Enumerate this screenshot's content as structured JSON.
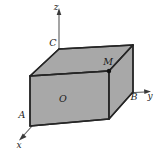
{
  "figure": {
    "background_color": "#ffffff",
    "box_fill_color": "#a8a8a8",
    "box_edge_color": "#262626",
    "axis_color": "#4a4a4a",
    "point_color": "#111111",
    "axes": [
      {
        "name": "z-axis",
        "label": "z",
        "label_x": 57,
        "label_y": 9
      },
      {
        "name": "y-axis",
        "label": "y",
        "label_x": 150,
        "label_y": 98
      },
      {
        "name": "x-axis",
        "label": "x",
        "label_x": 18,
        "label_y": 145
      }
    ],
    "vertices": [
      {
        "name": "origin",
        "label": "O",
        "label_x": 59,
        "label_y": 99
      },
      {
        "name": "vertex-A",
        "label": "A",
        "label_x": 22,
        "label_y": 116
      },
      {
        "name": "vertex-B",
        "label": "B",
        "label_x": 133,
        "label_y": 99
      },
      {
        "name": "vertex-C",
        "label": "C",
        "label_x": 52,
        "label_y": 45
      },
      {
        "name": "point-M",
        "label": "M",
        "label_x": 105,
        "label_y": 63
      }
    ],
    "marked_points": [
      {
        "name": "point-M-dot",
        "cx": 109,
        "cy": 71,
        "r": 2.1
      }
    ]
  }
}
